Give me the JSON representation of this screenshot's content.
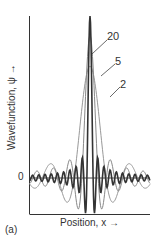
{
  "chart_data": {
    "type": "line",
    "title": "",
    "panel_label": "(a)",
    "xlabel": "Position, x →",
    "ylabel": "Wavefunction, ψ →",
    "ytick_labels": [
      "0"
    ],
    "grid": false,
    "legend": "inline labels",
    "xlim": [
      -1,
      1
    ],
    "x": [
      -1.0,
      -0.9,
      -0.8,
      -0.7,
      -0.6,
      -0.5,
      -0.4,
      -0.3,
      -0.2,
      -0.1,
      0.0,
      0.1,
      0.2,
      0.3,
      0.4,
      0.5,
      0.6,
      0.7,
      0.8,
      0.9,
      1.0
    ],
    "series": [
      {
        "name": "20",
        "color": "#333333",
        "width": 1.6,
        "peak": 1.0,
        "freq": 19.5,
        "values": [
          0.05,
          0.06,
          -0.08,
          0.09,
          -0.1,
          0.11,
          -0.13,
          0.16,
          -0.18,
          0.0,
          1.0,
          0.0,
          -0.18,
          0.16,
          -0.13,
          0.11,
          -0.1,
          0.09,
          -0.08,
          0.06,
          0.05
        ]
      },
      {
        "name": "5",
        "color": "#888888",
        "width": 1.0,
        "peak": 0.88,
        "freq": 7.4,
        "values": [
          0.11,
          0.05,
          -0.12,
          -0.22,
          -0.12,
          0.16,
          0.46,
          0.72,
          0.85,
          0.87,
          0.88,
          0.87,
          0.85,
          0.72,
          0.46,
          0.16,
          -0.12,
          -0.22,
          -0.12,
          0.05,
          0.11
        ]
      },
      {
        "name": "2",
        "color": "#999999",
        "width": 1.0,
        "peak": 0.69,
        "freq": 3.8,
        "values": [
          -0.14,
          -0.05,
          0.05,
          0.16,
          0.28,
          0.39,
          0.5,
          0.59,
          0.65,
          0.68,
          0.69,
          0.68,
          0.65,
          0.59,
          0.5,
          0.39,
          0.28,
          0.16,
          0.05,
          -0.05,
          -0.14
        ]
      }
    ],
    "annotations": [
      {
        "text": "20",
        "series": "20"
      },
      {
        "text": "5",
        "series": "5"
      },
      {
        "text": "2",
        "series": "2"
      }
    ]
  }
}
